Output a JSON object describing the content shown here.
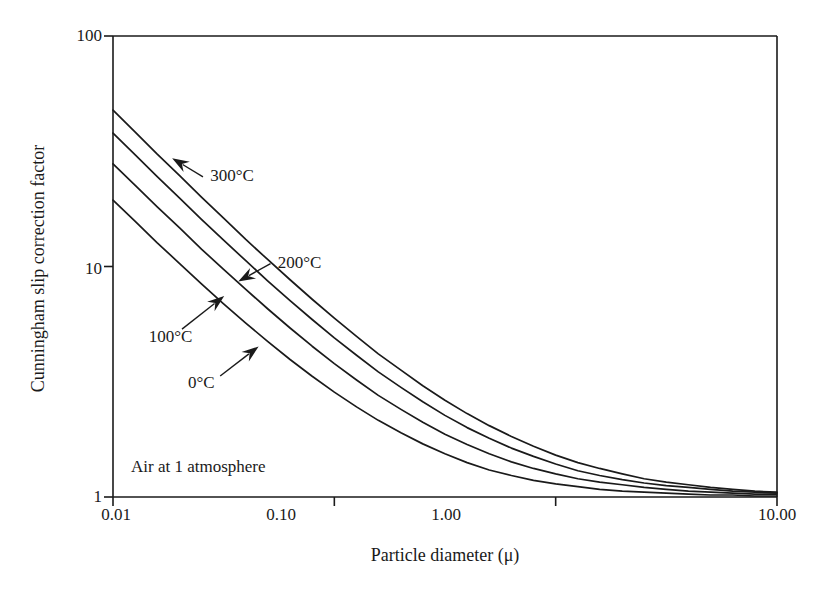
{
  "figure": {
    "background_color": "#ffffff",
    "ink_color": "#1a1a1a"
  },
  "chart_data": {
    "type": "line",
    "title": "",
    "xlabel": "Particle diameter (μ)",
    "ylabel": "Cunningham slip correction factor",
    "xscale": "log",
    "yscale": "log",
    "xlim": [
      0.01,
      10.0
    ],
    "ylim": [
      1,
      100
    ],
    "grid": false,
    "legend": "inline-annotations",
    "xticks": [
      0.01,
      0.1,
      1.0,
      10.0
    ],
    "xticklabels": [
      "0.01",
      "0.10",
      "1.00",
      "10.00"
    ],
    "yticks": [
      1,
      10,
      100
    ],
    "yticklabels": [
      "1",
      "10",
      "100"
    ],
    "annotations": [
      {
        "text": "Air at 1 atmosphere",
        "x": 0.0145,
        "y": 1.3
      }
    ],
    "series": [
      {
        "name": "300°C",
        "label": "300°C",
        "label_x": 0.0275,
        "label_y": 24.5,
        "arrow_from_x": 0.0255,
        "arrow_from_y": 24.5,
        "arrow_to_x": 0.0185,
        "arrow_to_y": 29.5,
        "x": [
          0.01,
          0.0126,
          0.0158,
          0.02,
          0.0251,
          0.0316,
          0.0398,
          0.0501,
          0.0631,
          0.0794,
          0.1,
          0.126,
          0.158,
          0.2,
          0.251,
          0.316,
          0.398,
          0.501,
          0.631,
          0.794,
          1.0,
          1.26,
          1.58,
          2.0,
          2.51,
          3.16,
          3.98,
          5.01,
          6.31,
          7.94,
          10.0
        ],
        "y": [
          47.7,
          38.3,
          30.8,
          24.8,
          20.0,
          16.2,
          13.1,
          10.7,
          8.76,
          7.21,
          5.97,
          4.98,
          4.18,
          3.55,
          3.04,
          2.63,
          2.3,
          2.04,
          1.83,
          1.66,
          1.52,
          1.41,
          1.33,
          1.26,
          1.2,
          1.16,
          1.13,
          1.1,
          1.08,
          1.06,
          1.05
        ]
      },
      {
        "name": "200°C",
        "label": "200°C",
        "label_x": 0.0555,
        "label_y": 10.3,
        "arrow_from_x": 0.0515,
        "arrow_from_y": 10.3,
        "arrow_to_x": 0.0368,
        "arrow_to_y": 8.6,
        "x": [
          0.01,
          0.0126,
          0.0158,
          0.02,
          0.0251,
          0.0316,
          0.0398,
          0.0501,
          0.0631,
          0.0794,
          0.1,
          0.126,
          0.158,
          0.2,
          0.251,
          0.316,
          0.398,
          0.501,
          0.631,
          0.794,
          1.0,
          1.26,
          1.58,
          2.0,
          2.51,
          3.16,
          3.98,
          5.01,
          6.31,
          7.94,
          10.0
        ],
        "y": [
          37.9,
          30.5,
          24.6,
          19.8,
          16.0,
          13.0,
          10.6,
          8.65,
          7.11,
          5.89,
          4.9,
          4.12,
          3.49,
          2.99,
          2.59,
          2.26,
          2.0,
          1.8,
          1.63,
          1.5,
          1.39,
          1.3,
          1.24,
          1.19,
          1.15,
          1.12,
          1.1,
          1.08,
          1.06,
          1.05,
          1.04
        ]
      },
      {
        "name": "100°C",
        "label": "100°C",
        "label_x": 0.0145,
        "label_y": 4.9,
        "arrow_from_x": 0.0205,
        "arrow_from_y": 5.35,
        "arrow_to_x": 0.0318,
        "arrow_to_y": 7.45,
        "x": [
          0.01,
          0.0126,
          0.0158,
          0.02,
          0.0251,
          0.0316,
          0.0398,
          0.0501,
          0.0631,
          0.0794,
          0.1,
          0.126,
          0.158,
          0.2,
          0.251,
          0.316,
          0.398,
          0.501,
          0.631,
          0.794,
          1.0,
          1.26,
          1.58,
          2.0,
          2.51,
          3.16,
          3.98,
          5.01,
          6.31,
          7.94,
          10.0
        ],
        "y": [
          27.9,
          22.5,
          18.2,
          14.7,
          11.9,
          9.71,
          7.95,
          6.54,
          5.41,
          4.51,
          3.79,
          3.22,
          2.76,
          2.4,
          2.11,
          1.87,
          1.69,
          1.54,
          1.42,
          1.33,
          1.26,
          1.2,
          1.16,
          1.13,
          1.1,
          1.08,
          1.06,
          1.05,
          1.04,
          1.03,
          1.03
        ]
      },
      {
        "name": "0°C",
        "label": "0°C",
        "label_x": 0.0218,
        "label_y": 3.1,
        "arrow_from_x": 0.0305,
        "arrow_from_y": 3.35,
        "arrow_to_x": 0.0455,
        "arrow_to_y": 4.5,
        "x": [
          0.01,
          0.0126,
          0.0158,
          0.02,
          0.0251,
          0.0316,
          0.0398,
          0.0501,
          0.0631,
          0.0794,
          0.1,
          0.126,
          0.158,
          0.2,
          0.251,
          0.316,
          0.398,
          0.501,
          0.631,
          0.794,
          1.0,
          1.26,
          1.58,
          2.0,
          2.51,
          3.16,
          3.98,
          5.01,
          6.31,
          7.94,
          10.0
        ],
        "y": [
          19.4,
          15.7,
          12.7,
          10.3,
          8.4,
          6.89,
          5.68,
          4.72,
          3.95,
          3.34,
          2.85,
          2.46,
          2.15,
          1.9,
          1.7,
          1.54,
          1.41,
          1.31,
          1.24,
          1.18,
          1.14,
          1.11,
          1.08,
          1.06,
          1.05,
          1.04,
          1.03,
          1.02,
          1.02,
          1.01,
          1.01
        ]
      }
    ]
  },
  "axes": {
    "x_title": "Particle diameter (μ)",
    "y_title": "Cunningham slip correction factor",
    "x_tick_labels": [
      "0.01",
      "0.10",
      "1.00",
      "10.00"
    ],
    "y_tick_labels": [
      "100",
      "10",
      "1"
    ]
  },
  "labels": {
    "c300": "300°C",
    "c200": "200°C",
    "c100": "100°C",
    "c0": "0°C",
    "note": "Air at 1 atmosphere"
  }
}
